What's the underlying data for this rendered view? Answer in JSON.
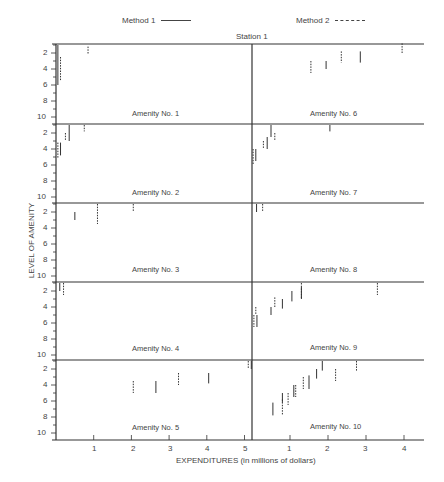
{
  "chart_data": {
    "type": "scatter",
    "title": "Station 1",
    "xlabel": "EXPENDITURES (in millions of dollars)",
    "ylabel": "LEVEL OF AMENITY",
    "legend": [
      {
        "name": "Method 1",
        "style": "solid"
      },
      {
        "name": "Method 2",
        "style": "dashed"
      }
    ],
    "y_ticks": [
      2,
      4,
      6,
      8,
      10
    ],
    "y_inverted": true,
    "left_x_ticks": [
      1,
      2,
      3,
      4,
      5
    ],
    "right_x_ticks": [
      1,
      2,
      3,
      4
    ],
    "grid": false,
    "panels": [
      {
        "name": "Amenity No. 1",
        "col": 0,
        "row": 0,
        "segments": [
          {
            "method": 1,
            "x": 0.05,
            "y1": 1,
            "y2": 6
          },
          {
            "method": 2,
            "x": 0.12,
            "y1": 2.5,
            "y2": 5.5
          },
          {
            "method": 2,
            "x": 0.85,
            "y1": 1.2,
            "y2": 2.2
          }
        ]
      },
      {
        "name": "Amenity No. 6",
        "col": 1,
        "row": 0,
        "segments": [
          {
            "method": 2,
            "x": 1.55,
            "y1": 3,
            "y2": 4.5
          },
          {
            "method": 1,
            "x": 1.95,
            "y1": 3,
            "y2": 4
          },
          {
            "method": 2,
            "x": 2.35,
            "y1": 1.8,
            "y2": 3.2
          },
          {
            "method": 1,
            "x": 2.85,
            "y1": 1.8,
            "y2": 3.2
          },
          {
            "method": 2,
            "x": 3.95,
            "y1": 0.8,
            "y2": 2
          }
        ]
      },
      {
        "name": "Amenity No. 2",
        "col": 0,
        "row": 1,
        "segments": [
          {
            "method": 2,
            "x": 0.05,
            "y1": 3.2,
            "y2": 5.2
          },
          {
            "method": 1,
            "x": 0.12,
            "y1": 3.2,
            "y2": 4.8
          },
          {
            "method": 2,
            "x": 0.25,
            "y1": 2,
            "y2": 3
          },
          {
            "method": 1,
            "x": 0.35,
            "y1": 1,
            "y2": 3
          },
          {
            "method": 2,
            "x": 0.75,
            "y1": 1,
            "y2": 1.8
          }
        ]
      },
      {
        "name": "Amenity No. 7",
        "col": 1,
        "row": 1,
        "segments": [
          {
            "method": 2,
            "x": 0.03,
            "y1": 4,
            "y2": 6
          },
          {
            "method": 1,
            "x": 0.1,
            "y1": 4,
            "y2": 5.5
          },
          {
            "method": 2,
            "x": 0.3,
            "y1": 3,
            "y2": 4
          },
          {
            "method": 1,
            "x": 0.4,
            "y1": 2.5,
            "y2": 4
          },
          {
            "method": 1,
            "x": 0.5,
            "y1": 1,
            "y2": 2.5
          },
          {
            "method": 2,
            "x": 0.6,
            "y1": 2,
            "y2": 3
          },
          {
            "method": 1,
            "x": 2.05,
            "y1": 1,
            "y2": 1.8
          }
        ]
      },
      {
        "name": "Amenity No. 3",
        "col": 0,
        "row": 2,
        "segments": [
          {
            "method": 1,
            "x": 0.5,
            "y1": 2,
            "y2": 3
          },
          {
            "method": 2,
            "x": 1.1,
            "y1": 1,
            "y2": 3.5
          },
          {
            "method": 2,
            "x": 2.05,
            "y1": 1,
            "y2": 2
          }
        ]
      },
      {
        "name": "Amenity No. 8",
        "col": 1,
        "row": 2,
        "segments": [
          {
            "method": 1,
            "x": 0.12,
            "y1": 1,
            "y2": 2
          },
          {
            "method": 2,
            "x": 0.28,
            "y1": 1,
            "y2": 2
          }
        ]
      },
      {
        "name": "Amenity No. 4",
        "col": 0,
        "row": 3,
        "segments": [
          {
            "method": 1,
            "x": 0.1,
            "y1": 1,
            "y2": 2
          },
          {
            "method": 2,
            "x": 0.2,
            "y1": 1,
            "y2": 2.5
          }
        ]
      },
      {
        "name": "Amenity No. 9",
        "col": 1,
        "row": 3,
        "segments": [
          {
            "method": 2,
            "x": 0.05,
            "y1": 5,
            "y2": 6.5
          },
          {
            "method": 1,
            "x": 0.13,
            "y1": 5,
            "y2": 6.5
          },
          {
            "method": 2,
            "x": 0.1,
            "y1": 4,
            "y2": 5
          },
          {
            "method": 1,
            "x": 0.5,
            "y1": 4,
            "y2": 5
          },
          {
            "method": 2,
            "x": 0.6,
            "y1": 2.8,
            "y2": 4
          },
          {
            "method": 1,
            "x": 0.8,
            "y1": 3,
            "y2": 4.2
          },
          {
            "method": 1,
            "x": 1.05,
            "y1": 2,
            "y2": 3.3
          },
          {
            "method": 1,
            "x": 1.3,
            "y1": 1.5,
            "y2": 3
          },
          {
            "method": 2,
            "x": 1.3,
            "y1": 1,
            "y2": 3
          },
          {
            "method": 2,
            "x": 3.3,
            "y1": 1,
            "y2": 2.5
          }
        ]
      },
      {
        "name": "Amenity No. 5",
        "col": 0,
        "row": 4,
        "segments": [
          {
            "method": 2,
            "x": 2.05,
            "y1": 3.5,
            "y2": 5
          },
          {
            "method": 1,
            "x": 2.65,
            "y1": 3.5,
            "y2": 5
          },
          {
            "method": 2,
            "x": 3.25,
            "y1": 2.5,
            "y2": 4
          },
          {
            "method": 1,
            "x": 4.05,
            "y1": 2.5,
            "y2": 3.8
          },
          {
            "method": 2,
            "x": 5.1,
            "y1": 1,
            "y2": 2
          },
          {
            "method": 1,
            "x": 5.18,
            "y1": 1,
            "y2": 2
          }
        ]
      },
      {
        "name": "Amenity No. 10",
        "col": 1,
        "row": 4,
        "segments": [
          {
            "method": 1,
            "x": 0.55,
            "y1": 6.2,
            "y2": 7.8
          },
          {
            "method": 2,
            "x": 0.8,
            "y1": 5.8,
            "y2": 7.8
          },
          {
            "method": 1,
            "x": 0.8,
            "y1": 5,
            "y2": 6.2
          },
          {
            "method": 2,
            "x": 0.95,
            "y1": 5,
            "y2": 6.5
          },
          {
            "method": 1,
            "x": 1.1,
            "y1": 4,
            "y2": 5.5
          },
          {
            "method": 2,
            "x": 1.15,
            "y1": 4,
            "y2": 5.5
          },
          {
            "method": 2,
            "x": 1.35,
            "y1": 3,
            "y2": 4.5
          },
          {
            "method": 1,
            "x": 1.5,
            "y1": 2.8,
            "y2": 4.5
          },
          {
            "method": 1,
            "x": 1.7,
            "y1": 2,
            "y2": 3.2
          },
          {
            "method": 1,
            "x": 1.85,
            "y1": 1,
            "y2": 2.2
          },
          {
            "method": 2,
            "x": 2.2,
            "y1": 2,
            "y2": 3.5
          },
          {
            "method": 2,
            "x": 2.75,
            "y1": 1,
            "y2": 2.2
          }
        ]
      }
    ]
  },
  "legend": {
    "method1": "Method 1",
    "method2": "Method 2"
  },
  "station": "Station 1",
  "ylabel": "LEVEL OF AMENITY",
  "xlabel": "EXPENDITURES (in millions of dollars)",
  "panels_labels": {
    "a1": "Amenity No. 1",
    "a2": "Amenity No. 2",
    "a3": "Amenity No. 3",
    "a4": "Amenity No. 4",
    "a5": "Amenity No. 5",
    "a6": "Amenity No. 6",
    "a7": "Amenity No. 7",
    "a8": "Amenity No. 8",
    "a9": "Amenity No. 9",
    "a10": "Amenity No. 10"
  },
  "x_ticks": {
    "left": [
      "1",
      "2",
      "3",
      "4",
      "5"
    ],
    "right": [
      "1",
      "2",
      "3",
      "4"
    ]
  },
  "y_ticks": [
    "2",
    "4",
    "6",
    "8",
    "10"
  ]
}
